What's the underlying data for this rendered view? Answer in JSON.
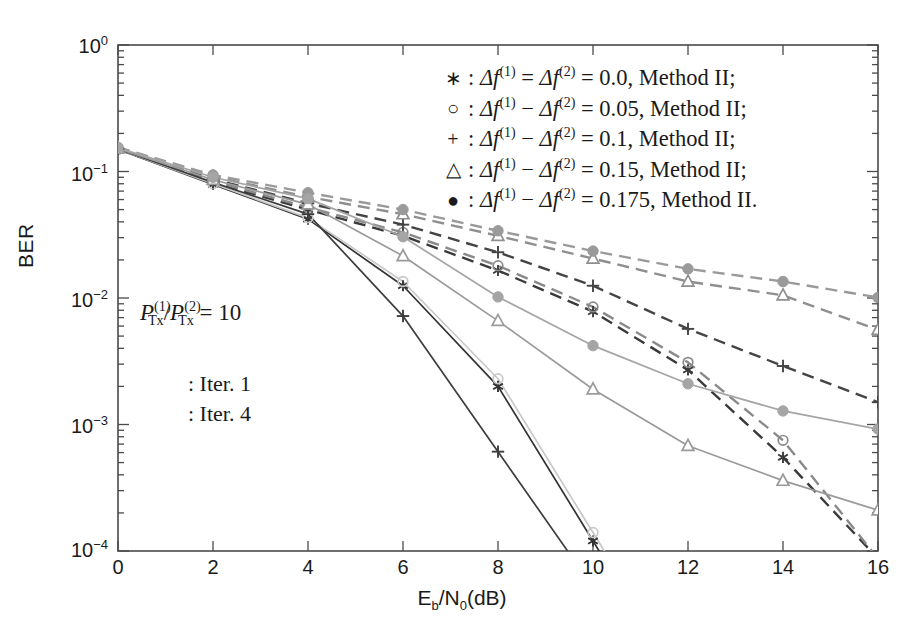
{
  "figure": {
    "axis_box": {
      "left": 118,
      "top": 45,
      "right": 878,
      "bottom": 551
    }
  },
  "chart_data": {
    "type": "line",
    "title": "",
    "xlabel": "Eb/N0(dB)",
    "ylabel": "BER",
    "xlim": [
      0,
      16
    ],
    "ylim": [
      0.0001,
      1
    ],
    "yscale": "log",
    "xticks": [
      "0",
      "2",
      "4",
      "6",
      "8",
      "10",
      "12",
      "14",
      "16"
    ],
    "yticks": [
      "10^0",
      "10^-1",
      "10^-2",
      "10^-3",
      "10^-4"
    ],
    "grid": false,
    "legend_position": "upper-right-inside",
    "x": [
      0,
      2,
      4,
      6,
      8,
      10,
      12,
      14,
      16
    ],
    "series": [
      {
        "name": "star-iter1",
        "marker": "*",
        "linestyle": "dashed",
        "iteration": "Iter. 1",
        "color": "#3a3a3a",
        "values": [
          0.15,
          0.082,
          0.05,
          0.031,
          0.0165,
          0.0078,
          0.0027,
          0.00055,
          null
        ]
      },
      {
        "name": "circle-open-iter1",
        "marker": "o",
        "linestyle": "dashed",
        "iteration": "Iter. 1",
        "color": "#8a8a8a",
        "values": [
          0.15,
          0.084,
          0.052,
          0.033,
          0.018,
          0.0085,
          0.0031,
          0.00075,
          null
        ]
      },
      {
        "name": "plus-iter1",
        "marker": "+",
        "linestyle": "dashed",
        "iteration": "Iter. 1",
        "color": "#444444",
        "values": [
          0.152,
          0.087,
          0.056,
          0.038,
          0.023,
          0.0125,
          0.0057,
          0.0029,
          0.0015
        ]
      },
      {
        "name": "triangle-iter1",
        "marker": "triangle",
        "linestyle": "dashed",
        "iteration": "Iter. 1",
        "color": "#8f8f8f",
        "values": [
          0.153,
          0.091,
          0.063,
          0.046,
          0.031,
          0.0205,
          0.0135,
          0.0105,
          0.0056
        ]
      },
      {
        "name": "dot-iter1",
        "marker": "dot",
        "linestyle": "dashed",
        "iteration": "Iter. 1",
        "color": "#9a9a9a",
        "values": [
          0.155,
          0.094,
          0.068,
          0.05,
          0.034,
          0.0235,
          0.017,
          0.0135,
          0.0101
        ]
      },
      {
        "name": "star-iter4",
        "marker": "*",
        "linestyle": "solid",
        "iteration": "Iter. 4",
        "color": "#333333",
        "values": [
          0.15,
          0.079,
          0.042,
          0.0125,
          0.002,
          0.00012,
          null,
          null,
          null
        ]
      },
      {
        "name": "circle-open-iter4",
        "marker": "o",
        "linestyle": "solid",
        "iteration": "Iter. 4",
        "color": "#c8c8c8",
        "values": [
          0.15,
          0.08,
          0.043,
          0.0135,
          0.0023,
          0.00014,
          null,
          null,
          null
        ]
      },
      {
        "name": "plus-iter4",
        "marker": "+",
        "linestyle": "solid",
        "iteration": "Iter. 4",
        "color": "#3d3d3d",
        "values": [
          0.151,
          0.082,
          0.046,
          0.0072,
          0.00061,
          null,
          null,
          null,
          null
        ]
      },
      {
        "name": "triangle-iter4",
        "marker": "triangle",
        "linestyle": "solid",
        "iteration": "Iter. 4",
        "color": "#9a9a9a",
        "values": [
          0.152,
          0.086,
          0.055,
          0.0215,
          0.0066,
          0.0019,
          0.00068,
          0.00036,
          0.00021
        ]
      },
      {
        "name": "dot-iter4",
        "marker": "dot",
        "linestyle": "solid",
        "iteration": "Iter. 4",
        "color": "#a5a5a5",
        "values": [
          0.154,
          0.09,
          0.061,
          0.0305,
          0.0102,
          0.0042,
          0.0021,
          0.00128,
          0.00092
        ]
      }
    ]
  },
  "axis": {
    "ylabel": "BER",
    "xlabel_prefix": "E",
    "xlabel_sub1": "b",
    "xlabel_mid": "/N",
    "xlabel_sub2": "0",
    "xlabel_suffix": "(dB)",
    "yticks": [
      {
        "mantissa": "10",
        "exp": "0"
      },
      {
        "mantissa": "10",
        "exp": "−1"
      },
      {
        "mantissa": "10",
        "exp": "−2"
      },
      {
        "mantissa": "10",
        "exp": "−3"
      },
      {
        "mantissa": "10",
        "exp": "−4"
      }
    ],
    "xticks": [
      "0",
      "2",
      "4",
      "6",
      "8",
      "10",
      "12",
      "14",
      "16"
    ]
  },
  "legend": {
    "entries": [
      {
        "symbol": "∗",
        "text": "Δf⁽¹⁾ = Δf⁽²⁾ = 0.0, Method II;",
        "delta1": "Δ",
        "f1": "f",
        "sup1": "(1)",
        "op": "=",
        "delta2": "Δ",
        "f2": "f",
        "sup2": "(2)",
        "eq": "=",
        "value": "0.0",
        "method": ", Method II;"
      },
      {
        "symbol": "○",
        "text": "Δf⁽¹⁾ − Δf⁽²⁾ = 0.05, Method II;",
        "delta1": "Δ",
        "f1": "f",
        "sup1": "(1)",
        "op": "−",
        "delta2": "Δ",
        "f2": "f",
        "sup2": "(2)",
        "eq": "=",
        "value": "0.05",
        "method": ", Method II;"
      },
      {
        "symbol": "+",
        "text": "Δf⁽¹⁾ − Δf⁽²⁾ = 0.1, Method II;",
        "delta1": "Δ",
        "f1": "f",
        "sup1": "(1)",
        "op": "−",
        "delta2": "Δ",
        "f2": "f",
        "sup2": "(2)",
        "eq": "=",
        "value": "0.1",
        "method": ", Method II;"
      },
      {
        "symbol": "△",
        "text": "Δf⁽¹⁾ − Δf⁽²⁾ = 0.15, Method II;",
        "delta1": "Δ",
        "f1": "f",
        "sup1": "(1)",
        "op": "−",
        "delta2": "Δ",
        "f2": "f",
        "sup2": "(2)",
        "eq": "=",
        "value": "0.15",
        "method": ", Method II;"
      },
      {
        "symbol": "●",
        "text": "Δf⁽¹⁾ − Δf⁽²⁾ = 0.175, Method II.",
        "delta1": "Δ",
        "f1": "f",
        "sup1": "(1)",
        "op": "−",
        "delta2": "Δ",
        "f2": "f",
        "sup2": "(2)",
        "eq": "=",
        "value": "0.175",
        "method": ", Method II."
      }
    ]
  },
  "annotations": {
    "power_ratio": {
      "p1": "P",
      "sub1": "Tx",
      "sup1": "(1)",
      "slash": "/",
      "p2": "P",
      "sub2": "Tx",
      "sup2": "(2)",
      "eq": "=",
      "value": "10"
    },
    "iter1_label": ": Iter. 1",
    "iter4_label": ": Iter. 4"
  }
}
